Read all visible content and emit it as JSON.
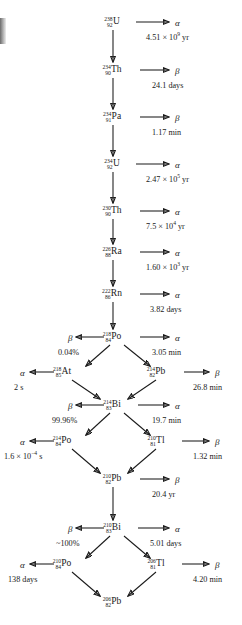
{
  "diagram": {
    "alpha_symbol": "α",
    "beta_symbol": "β",
    "nuclides": [
      {
        "id": "u238",
        "a": "238",
        "z": "92",
        "symbol": "U",
        "x": 112,
        "y": 22
      },
      {
        "id": "th234",
        "a": "234",
        "z": "90",
        "symbol": "Th",
        "x": 112,
        "y": 70
      },
      {
        "id": "pa234",
        "a": "234",
        "z": "91",
        "symbol": "Pa",
        "x": 112,
        "y": 117
      },
      {
        "id": "u234",
        "a": "234",
        "z": "92",
        "symbol": "U",
        "x": 112,
        "y": 164
      },
      {
        "id": "th230",
        "a": "230",
        "z": "90",
        "symbol": "Th",
        "x": 112,
        "y": 211
      },
      {
        "id": "ra226",
        "a": "226",
        "z": "88",
        "symbol": "Ra",
        "x": 112,
        "y": 252
      },
      {
        "id": "rn222",
        "a": "222",
        "z": "86",
        "symbol": "Rn",
        "x": 112,
        "y": 294
      },
      {
        "id": "po218",
        "a": "218",
        "z": "84",
        "symbol": "Po",
        "x": 112,
        "y": 337
      },
      {
        "id": "at218",
        "a": "218",
        "z": "85",
        "symbol": "At",
        "x": 62,
        "y": 372
      },
      {
        "id": "pb214",
        "a": "214",
        "z": "82",
        "symbol": "Pb",
        "x": 156,
        "y": 372
      },
      {
        "id": "bi214",
        "a": "214",
        "z": "83",
        "symbol": "Bi",
        "x": 112,
        "y": 405
      },
      {
        "id": "po214",
        "a": "214",
        "z": "84",
        "symbol": "Po",
        "x": 62,
        "y": 441
      },
      {
        "id": "tl210",
        "a": "210",
        "z": "81",
        "symbol": "Tl",
        "x": 156,
        "y": 441
      },
      {
        "id": "pb210",
        "a": "210",
        "z": "82",
        "symbol": "Pb",
        "x": 112,
        "y": 479
      },
      {
        "id": "bi210",
        "a": "210",
        "z": "83",
        "symbol": "Bi",
        "x": 112,
        "y": 528
      },
      {
        "id": "po210",
        "a": "210",
        "z": "84",
        "symbol": "Po",
        "x": 62,
        "y": 564
      },
      {
        "id": "tl206",
        "a": "206",
        "z": "81",
        "symbol": "Tl",
        "x": 156,
        "y": 564
      },
      {
        "id": "pb206",
        "a": "206",
        "z": "82",
        "symbol": "Pb",
        "x": 112,
        "y": 602
      }
    ],
    "decay_modes": [
      {
        "id": "m-u238",
        "label": "α",
        "x": 175,
        "y": 19
      },
      {
        "id": "m-th234",
        "label": "β",
        "x": 175,
        "y": 67
      },
      {
        "id": "m-pa234",
        "label": "β",
        "x": 175,
        "y": 114
      },
      {
        "id": "m-u234",
        "label": "α",
        "x": 175,
        "y": 161
      },
      {
        "id": "m-th230",
        "label": "α",
        "x": 175,
        "y": 208
      },
      {
        "id": "m-ra226",
        "label": "α",
        "x": 175,
        "y": 249
      },
      {
        "id": "m-rn222",
        "label": "α",
        "x": 175,
        "y": 291
      },
      {
        "id": "m-po218-b",
        "label": "β",
        "x": 68,
        "y": 334
      },
      {
        "id": "m-po218-a",
        "label": "α",
        "x": 175,
        "y": 334
      },
      {
        "id": "m-at218",
        "label": "α",
        "x": 20,
        "y": 369
      },
      {
        "id": "m-pb214",
        "label": "β",
        "x": 215,
        "y": 369
      },
      {
        "id": "m-bi214-b",
        "label": "β",
        "x": 68,
        "y": 402
      },
      {
        "id": "m-bi214-a",
        "label": "α",
        "x": 175,
        "y": 402
      },
      {
        "id": "m-po214",
        "label": "α",
        "x": 20,
        "y": 438
      },
      {
        "id": "m-tl210",
        "label": "β",
        "x": 215,
        "y": 438
      },
      {
        "id": "m-pb210",
        "label": "β",
        "x": 175,
        "y": 476
      },
      {
        "id": "m-bi210-b",
        "label": "β",
        "x": 68,
        "y": 525
      },
      {
        "id": "m-bi210-a",
        "label": "α",
        "x": 175,
        "y": 525
      },
      {
        "id": "m-po210",
        "label": "α",
        "x": 20,
        "y": 561
      },
      {
        "id": "m-tl206",
        "label": "β",
        "x": 215,
        "y": 561
      }
    ],
    "captions": [
      {
        "id": "c-u238",
        "html": "4.51 × 10<sup>9</sup> yr",
        "x": 146,
        "y": 34,
        "align": "left"
      },
      {
        "id": "c-th234",
        "html": "24.1 days",
        "x": 152,
        "y": 82,
        "align": "left"
      },
      {
        "id": "c-pa234",
        "html": "1.17 min",
        "x": 152,
        "y": 129,
        "align": "left"
      },
      {
        "id": "c-u234",
        "html": "2.47 × 10<sup>5</sup> yr",
        "x": 146,
        "y": 176,
        "align": "left"
      },
      {
        "id": "c-th230",
        "html": "7.5 × 10<sup>4</sup> yr",
        "x": 146,
        "y": 223,
        "align": "left"
      },
      {
        "id": "c-ra226",
        "html": "1.60 × 10<sup>3</sup> yr",
        "x": 146,
        "y": 264,
        "align": "left"
      },
      {
        "id": "c-rn222",
        "html": "3.82 days",
        "x": 150,
        "y": 306,
        "align": "left"
      },
      {
        "id": "c-po218-b",
        "html": "0.04%",
        "x": 58,
        "y": 349,
        "align": "left"
      },
      {
        "id": "c-po218-a",
        "html": "3.05 min",
        "x": 152,
        "y": 349,
        "align": "left"
      },
      {
        "id": "c-at218",
        "html": "2 s",
        "x": 14,
        "y": 384,
        "align": "left"
      },
      {
        "id": "c-pb214",
        "html": "26.8 min",
        "x": 193,
        "y": 384,
        "align": "left"
      },
      {
        "id": "c-bi214-b",
        "html": "99.96%",
        "x": 52,
        "y": 417,
        "align": "left"
      },
      {
        "id": "c-bi214-a",
        "html": "19.7 min",
        "x": 152,
        "y": 417,
        "align": "left"
      },
      {
        "id": "c-po214",
        "html": "1.6 × 10<sup>−4</sup> s",
        "x": 4,
        "y": 453,
        "align": "left"
      },
      {
        "id": "c-tl210",
        "html": "1.32 min",
        "x": 193,
        "y": 453,
        "align": "left"
      },
      {
        "id": "c-pb210",
        "html": "20.4 yr",
        "x": 152,
        "y": 491,
        "align": "left"
      },
      {
        "id": "c-bi210-b",
        "html": "~100%",
        "x": 56,
        "y": 540,
        "align": "left"
      },
      {
        "id": "c-bi210-a",
        "html": "5.01 days",
        "x": 150,
        "y": 540,
        "align": "left"
      },
      {
        "id": "c-po210",
        "html": "138 days",
        "x": 8,
        "y": 576,
        "align": "left"
      },
      {
        "id": "c-tl206",
        "html": "4.20 min",
        "x": 193,
        "y": 576,
        "align": "left"
      }
    ],
    "arrows": [
      {
        "id": "a-u238-right",
        "x1": 136,
        "y1": 22,
        "x2": 169,
        "y2": 22
      },
      {
        "id": "a-u238-down",
        "x1": 113,
        "y1": 30,
        "x2": 113,
        "y2": 62
      },
      {
        "id": "a-th234-right",
        "x1": 140,
        "y1": 70,
        "x2": 169,
        "y2": 70
      },
      {
        "id": "a-th234-down",
        "x1": 113,
        "y1": 78,
        "x2": 113,
        "y2": 109
      },
      {
        "id": "a-pa234-right",
        "x1": 140,
        "y1": 117,
        "x2": 169,
        "y2": 117
      },
      {
        "id": "a-pa234-down",
        "x1": 113,
        "y1": 125,
        "x2": 113,
        "y2": 156
      },
      {
        "id": "a-u234-right",
        "x1": 136,
        "y1": 164,
        "x2": 169,
        "y2": 164
      },
      {
        "id": "a-u234-down",
        "x1": 113,
        "y1": 172,
        "x2": 113,
        "y2": 203
      },
      {
        "id": "a-th230-right",
        "x1": 140,
        "y1": 211,
        "x2": 169,
        "y2": 211
      },
      {
        "id": "a-th230-down",
        "x1": 113,
        "y1": 219,
        "x2": 113,
        "y2": 244
      },
      {
        "id": "a-ra226-right",
        "x1": 140,
        "y1": 252,
        "x2": 169,
        "y2": 252
      },
      {
        "id": "a-ra226-down",
        "x1": 113,
        "y1": 260,
        "x2": 113,
        "y2": 286
      },
      {
        "id": "a-rn222-right",
        "x1": 140,
        "y1": 294,
        "x2": 169,
        "y2": 294
      },
      {
        "id": "a-rn222-down",
        "x1": 113,
        "y1": 302,
        "x2": 113,
        "y2": 329
      },
      {
        "id": "a-po218-left",
        "x1": 104,
        "y1": 337,
        "x2": 76,
        "y2": 337
      },
      {
        "id": "a-po218-right",
        "x1": 140,
        "y1": 337,
        "x2": 169,
        "y2": 337
      },
      {
        "id": "a-po218-dl",
        "x1": 110,
        "y1": 345,
        "x2": 86,
        "y2": 366
      },
      {
        "id": "a-po218-dr",
        "x1": 124,
        "y1": 345,
        "x2": 150,
        "y2": 366
      },
      {
        "id": "a-at218-left",
        "x1": 54,
        "y1": 372,
        "x2": 30,
        "y2": 372
      },
      {
        "id": "a-pb214-right",
        "x1": 184,
        "y1": 372,
        "x2": 209,
        "y2": 372
      },
      {
        "id": "a-at218-dr",
        "x1": 72,
        "y1": 380,
        "x2": 100,
        "y2": 399
      },
      {
        "id": "a-pb214-dl",
        "x1": 156,
        "y1": 380,
        "x2": 128,
        "y2": 399
      },
      {
        "id": "a-bi214-left",
        "x1": 104,
        "y1": 405,
        "x2": 76,
        "y2": 405
      },
      {
        "id": "a-bi214-right",
        "x1": 138,
        "y1": 405,
        "x2": 169,
        "y2": 405
      },
      {
        "id": "a-bi214-dl",
        "x1": 110,
        "y1": 413,
        "x2": 86,
        "y2": 435
      },
      {
        "id": "a-bi214-dr",
        "x1": 124,
        "y1": 413,
        "x2": 150,
        "y2": 435
      },
      {
        "id": "a-po214-left",
        "x1": 54,
        "y1": 441,
        "x2": 30,
        "y2": 441
      },
      {
        "id": "a-tl210-right",
        "x1": 182,
        "y1": 441,
        "x2": 209,
        "y2": 441
      },
      {
        "id": "a-po214-dr",
        "x1": 72,
        "y1": 449,
        "x2": 100,
        "y2": 473
      },
      {
        "id": "a-tl210-dl",
        "x1": 156,
        "y1": 449,
        "x2": 128,
        "y2": 473
      },
      {
        "id": "a-pb210-right",
        "x1": 140,
        "y1": 479,
        "x2": 169,
        "y2": 479
      },
      {
        "id": "a-pb210-down",
        "x1": 113,
        "y1": 487,
        "x2": 113,
        "y2": 520
      },
      {
        "id": "a-bi210-left",
        "x1": 104,
        "y1": 528,
        "x2": 76,
        "y2": 528
      },
      {
        "id": "a-bi210-right",
        "x1": 138,
        "y1": 528,
        "x2": 169,
        "y2": 528
      },
      {
        "id": "a-bi210-dl",
        "x1": 110,
        "y1": 536,
        "x2": 86,
        "y2": 558
      },
      {
        "id": "a-bi210-dr",
        "x1": 124,
        "y1": 536,
        "x2": 150,
        "y2": 558
      },
      {
        "id": "a-po210-left",
        "x1": 54,
        "y1": 564,
        "x2": 30,
        "y2": 564
      },
      {
        "id": "a-tl206-right",
        "x1": 182,
        "y1": 564,
        "x2": 209,
        "y2": 564
      },
      {
        "id": "a-po210-dr",
        "x1": 72,
        "y1": 572,
        "x2": 100,
        "y2": 596
      },
      {
        "id": "a-tl206-dl",
        "x1": 156,
        "y1": 572,
        "x2": 128,
        "y2": 596
      }
    ]
  }
}
